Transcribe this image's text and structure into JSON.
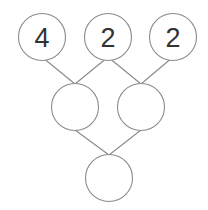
{
  "diagram": {
    "type": "number-pyramid",
    "colors": {
      "stroke": "#8a8a8a",
      "text": "#333333",
      "background": "#ffffff"
    },
    "nodes": [
      {
        "id": "top-1",
        "label": "4"
      },
      {
        "id": "top-2",
        "label": "2"
      },
      {
        "id": "top-3",
        "label": "2"
      },
      {
        "id": "mid-1",
        "label": ""
      },
      {
        "id": "mid-2",
        "label": ""
      },
      {
        "id": "bottom",
        "label": ""
      }
    ]
  }
}
